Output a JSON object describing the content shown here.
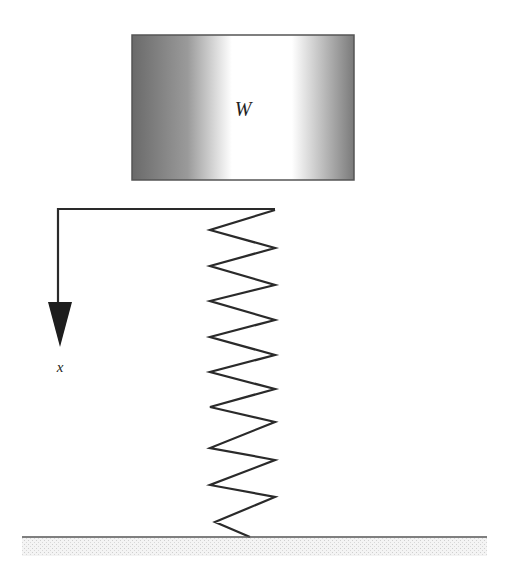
{
  "diagram": {
    "type": "mass-spring-system",
    "block": {
      "label": "W",
      "x": 132,
      "y": 35,
      "width": 222,
      "height": 145,
      "gradient": [
        "#6a6a6a",
        "#9a9a9a",
        "#ffffff",
        "#ffffff",
        "#7a7a7a"
      ]
    },
    "axis": {
      "label": "x",
      "direction": "down",
      "corner": [
        58,
        209
      ],
      "end": [
        275,
        209
      ],
      "arrow_tip": [
        60,
        347
      ]
    },
    "spring": {
      "points": [
        [
          275,
          210
        ],
        [
          210,
          230
        ],
        [
          275,
          248
        ],
        [
          210,
          266
        ],
        [
          275,
          285
        ],
        [
          210,
          301
        ],
        [
          275,
          320
        ],
        [
          210,
          337
        ],
        [
          275,
          355
        ],
        [
          210,
          372
        ],
        [
          275,
          389
        ],
        [
          210,
          407
        ],
        [
          275,
          422
        ],
        [
          210,
          448
        ],
        [
          275,
          460
        ],
        [
          210,
          485
        ],
        [
          275,
          497
        ],
        [
          215,
          522
        ],
        [
          250,
          537
        ]
      ]
    },
    "ground": {
      "x1": 22,
      "x2": 487,
      "y": 537
    },
    "colors": {
      "line": "#2a2a2a",
      "ground_fill": "#ececec"
    }
  }
}
